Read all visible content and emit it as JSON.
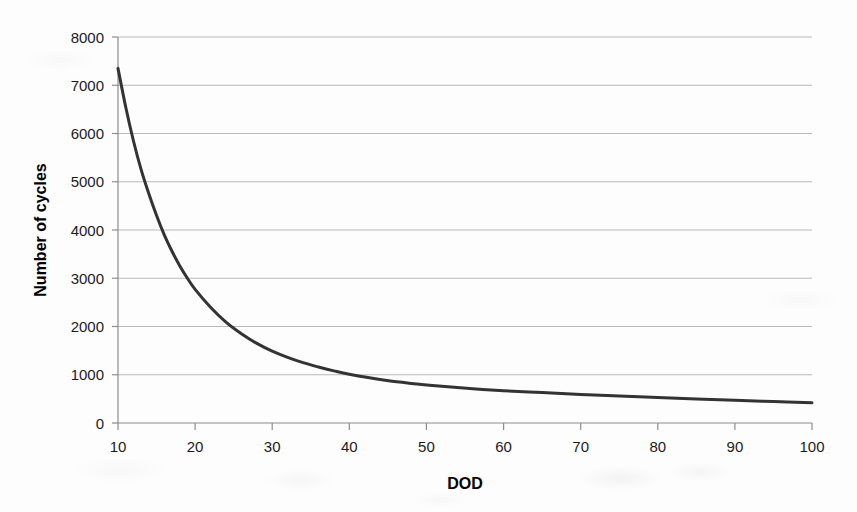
{
  "chart_data": {
    "type": "line",
    "title": "",
    "subtitle": "",
    "xlabel": "DOD",
    "ylabel": "Number of cycles",
    "xlim": [
      10,
      100
    ],
    "ylim": [
      0,
      8000
    ],
    "xticks": [
      10,
      20,
      30,
      40,
      50,
      60,
      70,
      80,
      90,
      100
    ],
    "yticks": [
      0,
      1000,
      2000,
      3000,
      4000,
      5000,
      6000,
      7000,
      8000
    ],
    "xtick_labels": [
      "10",
      "20",
      "30",
      "40",
      "50",
      "60",
      "70",
      "80",
      "90",
      "100"
    ],
    "ytick_labels": [
      "0",
      "1000",
      "2000",
      "3000",
      "4000",
      "5000",
      "6000",
      "7000",
      "8000"
    ],
    "grid": "horizontal",
    "legend": "none",
    "series": [
      {
        "name": "Cycle life vs depth of discharge",
        "color": "#333333",
        "line_width": 3,
        "x": [
          10,
          11,
          12,
          13,
          14,
          15,
          16,
          17,
          18,
          19,
          20,
          22,
          24,
          26,
          28,
          30,
          32,
          34,
          36,
          38,
          40,
          44,
          48,
          52,
          56,
          60,
          65,
          70,
          75,
          80,
          85,
          90,
          95,
          100
        ],
        "y": [
          7350,
          6550,
          5850,
          5250,
          4750,
          4300,
          3900,
          3560,
          3260,
          3000,
          2770,
          2400,
          2090,
          1850,
          1650,
          1490,
          1360,
          1250,
          1160,
          1080,
          1010,
          900,
          820,
          760,
          710,
          670,
          630,
          590,
          560,
          530,
          500,
          470,
          445,
          420
        ]
      }
    ],
    "annotations": []
  },
  "axis_titles": {
    "x": "DOD",
    "y": "Number of cycles"
  }
}
